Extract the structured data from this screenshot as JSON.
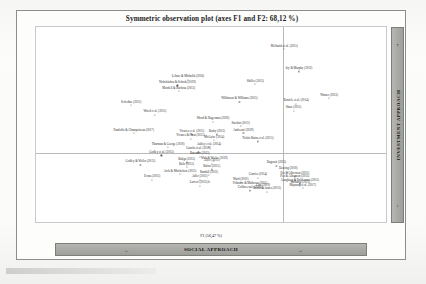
{
  "figure": {
    "title": "Symmetric observation plot (axes F1 and F2: 68,12 %)",
    "xlabel": "F1 (56,47 %)"
  },
  "banners": {
    "horizontal_label": "SOCIAL APPROACH",
    "vertical_label": "INVESTMENT APPROACH",
    "left_arrow": "←",
    "right_arrow": "→",
    "up_arrow": "↑",
    "down_arrow": "↓"
  },
  "axes": {
    "xticks": [
      "-1,5",
      "-1",
      "-0,5",
      "0",
      "0,5",
      "1"
    ],
    "yticks": [
      "1",
      "0,5",
      "0",
      "-0,5"
    ]
  },
  "chart_data": {
    "type": "scatter",
    "title": "Symmetric observation plot (axes F1 and F2: 68,12 %)",
    "xlabel": "F1 (56,47 %)",
    "ylabel": "F2",
    "xlim": [
      -1.5,
      1.15
    ],
    "ylim": [
      -0.62,
      1.05
    ],
    "grid": false,
    "legend": null,
    "annotations": {
      "x_axis_banner": "SOCIAL APPROACH",
      "y_axis_banner": "INVESTMENT APPROACH"
    },
    "points": [
      {
        "label": "Melhuish et al. (2015)",
        "x": 0.38,
        "y": 0.86
      },
      {
        "label": "Joy & Murphy (2012)",
        "x": 0.49,
        "y": 0.67
      },
      {
        "label": "Shiller (2013)",
        "x": 0.16,
        "y": 0.56
      },
      {
        "label": "Lehner & Michalik (2016)",
        "x": -0.35,
        "y": 0.6
      },
      {
        "label": "Nicholaidou & Schock (2019)",
        "x": -0.43,
        "y": 0.55
      },
      {
        "label": "Mendell & Barbosa (2013)",
        "x": -0.42,
        "y": 0.5
      },
      {
        "label": "Warner (2013)",
        "x": 0.72,
        "y": 0.44
      },
      {
        "label": "Wilkinson & Williams (2015)",
        "x": 0.04,
        "y": 0.41
      },
      {
        "label": "Ronicle et al. (2014)",
        "x": 0.47,
        "y": 0.39
      },
      {
        "label": "Sefiedine (2015)",
        "x": -0.78,
        "y": 0.38
      },
      {
        "label": "Shaw (2015)",
        "x": 0.45,
        "y": 0.33
      },
      {
        "label": "Wood et al. (2015)",
        "x": -0.6,
        "y": 0.3
      },
      {
        "label": "Wood & Hagerman (2020)",
        "x": -0.16,
        "y": 0.24
      },
      {
        "label": "Sinclair (2011)",
        "x": 0.05,
        "y": 0.2
      },
      {
        "label": "Pandolfo & Champoiseau (2017)",
        "x": -0.76,
        "y": 0.14
      },
      {
        "label": "Vivares et al. (2015)",
        "x": -0.32,
        "y": 0.13
      },
      {
        "label": "Barby (2011)",
        "x": -0.13,
        "y": 0.13
      },
      {
        "label": "Andreoni (2019)",
        "x": 0.07,
        "y": 0.14
      },
      {
        "label": "Vivares & Plaut (2015)",
        "x": -0.33,
        "y": 0.09
      },
      {
        "label": "McGuire (2014)",
        "x": -0.15,
        "y": 0.08
      },
      {
        "label": "Tiehin Rains et al. (2015)",
        "x": 0.18,
        "y": 0.07
      },
      {
        "label": "Thurman & George (2010)",
        "x": -0.5,
        "y": 0.02
      },
      {
        "label": "Ashley et al. (2014)",
        "x": -0.19,
        "y": 0.02
      },
      {
        "label": "Loucks et al. (2020)",
        "x": -0.27,
        "y": -0.02
      },
      {
        "label": "Godley et al. (2015)",
        "x": -0.55,
        "y": -0.05
      },
      {
        "label": "Bateman (2015)",
        "x": -0.26,
        "y": -0.06
      },
      {
        "label": "Walt & Weiler (2019)",
        "x": -0.15,
        "y": -0.1
      },
      {
        "label": "Baliga (2015)",
        "x": -0.36,
        "y": -0.11
      },
      {
        "label": "Allier (2011)",
        "x": -0.17,
        "y": -0.12
      },
      {
        "label": "Godley & Weiler (2015)",
        "x": -0.71,
        "y": -0.13
      },
      {
        "label": "Balir (2015)",
        "x": -0.36,
        "y": -0.15
      },
      {
        "label": "Dagrosit (2015)",
        "x": 0.32,
        "y": -0.14
      },
      {
        "label": "Balner (2015)",
        "x": -0.17,
        "y": -0.17
      },
      {
        "label": "Dearing (2010)",
        "x": 0.41,
        "y": -0.19
      },
      {
        "label": "Arch & Mitchelson (2015)",
        "x": -0.41,
        "y": -0.21
      },
      {
        "label": "Randall (2011)",
        "x": -0.19,
        "y": -0.22
      },
      {
        "label": "Conrier (2014)",
        "x": 0.18,
        "y": -0.24
      },
      {
        "label": "Pez & Albertson (2011)",
        "x": 0.46,
        "y": -0.23
      },
      {
        "label": "Pez & Albertson (2015)",
        "x": 0.46,
        "y": -0.26
      },
      {
        "label": "Evans (2015)",
        "x": -0.62,
        "y": -0.26
      },
      {
        "label": "Adler (2011)",
        "x": -0.26,
        "y": -0.26
      },
      {
        "label": "Ward (2010)",
        "x": 0.05,
        "y": -0.28
      },
      {
        "label": "Langberg & Balderman (2011)",
        "x": 0.5,
        "y": -0.29
      },
      {
        "label": "Warhurst (2015)",
        "x": 0.5,
        "y": -0.31
      },
      {
        "label": "Maynard et al. (2017)",
        "x": 0.52,
        "y": -0.33
      },
      {
        "label": "Fribourn & Mathews (2011)",
        "x": 0.12,
        "y": -0.32
      },
      {
        "label": "Larvert (2015) b",
        "x": -0.26,
        "y": -0.31
      },
      {
        "label": "Cho (2019)",
        "x": 0.22,
        "y": -0.33
      },
      {
        "label": "Collins et al. (2012)",
        "x": 0.12,
        "y": -0.35
      },
      {
        "label": "Booth & James (2012)",
        "x": 0.25,
        "y": -0.36
      }
    ]
  }
}
